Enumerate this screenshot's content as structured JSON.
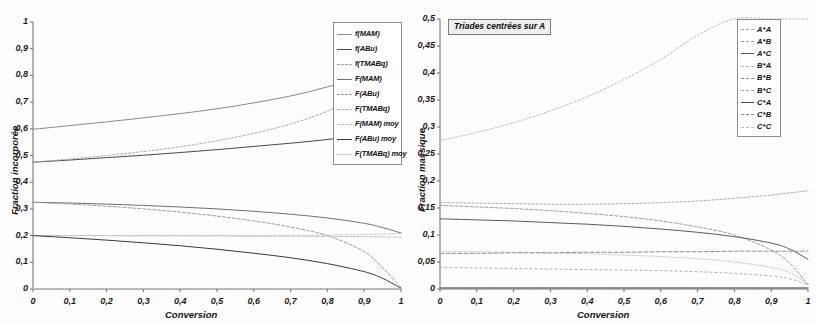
{
  "figure": {
    "background": "#fdfdfd",
    "axis_color": "#6f6f6f",
    "text_color": "#141414"
  },
  "panels": [
    {
      "id": "left",
      "annotation": "",
      "xaxis": {
        "label": "Conversion",
        "min": 0,
        "max": 1,
        "ticks": [
          "0",
          "0,1",
          "0,2",
          "0,3",
          "0,4",
          "0,5",
          "0,6",
          "0,7",
          "0,8",
          "0,9",
          "1"
        ]
      },
      "yaxis": {
        "label": "Fraction incorporée",
        "min": 0,
        "max": 1,
        "ticks": [
          "0",
          "0,1",
          "0,2",
          "0,3",
          "0,4",
          "0,5",
          "0,6",
          "0,7",
          "0,8",
          "0,9",
          "1"
        ]
      },
      "legend": [
        {
          "label": "f(MAM)",
          "color": "#8a8a8a",
          "dash": "none"
        },
        {
          "label": "f(ABu)",
          "color": "#4a4a4a",
          "dash": "none"
        },
        {
          "label": "f(TMABq)",
          "color": "#a8a8a8",
          "dash": "2,2"
        },
        {
          "label": "F(MAM)",
          "color": "#707070",
          "dash": "none"
        },
        {
          "label": "F(ABu)",
          "color": "#9b9b9b",
          "dash": "3,2"
        },
        {
          "label": "F(TMABq)",
          "color": "#b4b4b4",
          "dash": "1,2"
        },
        {
          "label": "F(MAM) moy",
          "color": "#bdbdbd",
          "dash": "4,2"
        },
        {
          "label": "F(ABu) moy",
          "color": "#3a3a3a",
          "dash": "none"
        },
        {
          "label": "F(TMABq) moy",
          "color": "#c2c2c2",
          "dash": "2,3"
        }
      ]
    },
    {
      "id": "right",
      "annotation": "Triades centrées sur A",
      "xaxis": {
        "label": "Conversion",
        "min": 0,
        "max": 1,
        "ticks": [
          "0",
          "0,1",
          "0,2",
          "0,3",
          "0,4",
          "0,5",
          "0,6",
          "0,7",
          "0,8",
          "0,9",
          "1"
        ]
      },
      "yaxis": {
        "label": "Fraction massique",
        "min": 0,
        "max": 0.5,
        "ticks": [
          "0",
          "0,05",
          "0,1",
          "0,15",
          "0,2",
          "0,25",
          "0,3",
          "0,35",
          "0,4",
          "0,45",
          "0,5"
        ]
      },
      "legend": [
        {
          "label": "A*A",
          "color": "#a9a9a9",
          "dash": "2,2"
        },
        {
          "label": "A*B",
          "color": "#9a9a9a",
          "dash": "3,2"
        },
        {
          "label": "A*C",
          "color": "#5a5a5a",
          "dash": "none"
        },
        {
          "label": "B*A",
          "color": "#b8b8b8",
          "dash": "1,2"
        },
        {
          "label": "B*B",
          "color": "#8d8d8d",
          "dash": "4,2"
        },
        {
          "label": "B*C",
          "color": "#ababab",
          "dash": "2,3"
        },
        {
          "label": "C*A",
          "color": "#4d4d4d",
          "dash": "none"
        },
        {
          "label": "C*B",
          "color": "#909090",
          "dash": "3,3"
        },
        {
          "label": "C*C",
          "color": "#bcbcbc",
          "dash": "2,2"
        }
      ]
    }
  ],
  "chart_data": [
    {
      "type": "line",
      "panel": "left",
      "title": "",
      "xlabel": "Conversion",
      "ylabel": "Fraction incorporée",
      "xlim": [
        0,
        1
      ],
      "ylim": [
        0,
        1
      ],
      "grid": false,
      "legend_position": "upper-right-inside",
      "x": [
        0,
        0.1,
        0.2,
        0.3,
        0.4,
        0.5,
        0.6,
        0.7,
        0.8,
        0.9,
        0.95,
        1
      ],
      "series": [
        {
          "name": "f(MAM)",
          "values": [
            0.598,
            0.612,
            0.626,
            0.641,
            0.657,
            0.675,
            0.697,
            0.723,
            0.757,
            0.8,
            0.822,
            0.84
          ]
        },
        {
          "name": "f(ABu)",
          "values": [
            0.475,
            0.483,
            0.492,
            0.501,
            0.511,
            0.522,
            0.534,
            0.546,
            0.56,
            0.578,
            0.588,
            0.598
          ]
        },
        {
          "name": "f(TMABq)",
          "values": [
            0.475,
            0.487,
            0.5,
            0.515,
            0.533,
            0.555,
            0.583,
            0.618,
            0.666,
            0.735,
            0.782,
            0.825
          ]
        },
        {
          "name": "F(MAM)",
          "values": [
            0.325,
            0.322,
            0.318,
            0.313,
            0.307,
            0.3,
            0.291,
            0.28,
            0.266,
            0.246,
            0.23,
            0.21
          ]
        },
        {
          "name": "F(ABu)",
          "values": [
            0.325,
            0.318,
            0.31,
            0.3,
            0.288,
            0.273,
            0.255,
            0.232,
            0.2,
            0.14,
            0.08,
            0.005
          ]
        },
        {
          "name": "F(TMABq)",
          "values": [
            0.2,
            0.2,
            0.2,
            0.2,
            0.2,
            0.2,
            0.2,
            0.201,
            0.202,
            0.204,
            0.206,
            0.208
          ]
        },
        {
          "name": "F(MAM) moy",
          "values": [
            0.2,
            0.2,
            0.2,
            0.199,
            0.199,
            0.199,
            0.198,
            0.198,
            0.197,
            0.196,
            0.195,
            0.194
          ]
        },
        {
          "name": "F(ABu) moy",
          "values": [
            0.2,
            0.192,
            0.183,
            0.173,
            0.162,
            0.149,
            0.134,
            0.117,
            0.095,
            0.065,
            0.04,
            0.003
          ]
        },
        {
          "name": "F(TMABq) moy",
          "values": [
            0.002,
            0.002,
            0.002,
            0.002,
            0.002,
            0.002,
            0.002,
            0.002,
            0.002,
            0.002,
            0.002,
            0.002
          ]
        }
      ]
    },
    {
      "type": "line",
      "panel": "right",
      "title": "Triades centrées sur A",
      "xlabel": "Conversion",
      "ylabel": "Fraction massique",
      "xlim": [
        0,
        1
      ],
      "ylim": [
        0,
        0.5
      ],
      "grid": false,
      "legend_position": "upper-right-inside",
      "x": [
        0,
        0.1,
        0.2,
        0.3,
        0.4,
        0.5,
        0.6,
        0.7,
        0.8,
        0.9,
        0.95,
        1
      ],
      "series": [
        {
          "name": "A*A",
          "values": [
            0.16,
            0.159,
            0.158,
            0.157,
            0.157,
            0.158,
            0.16,
            0.163,
            0.168,
            0.174,
            0.178,
            0.182
          ]
        },
        {
          "name": "A*B",
          "values": [
            0.155,
            0.152,
            0.149,
            0.145,
            0.14,
            0.134,
            0.126,
            0.115,
            0.1,
            0.072,
            0.048,
            0.008
          ]
        },
        {
          "name": "A*C",
          "values": [
            0.13,
            0.128,
            0.126,
            0.123,
            0.12,
            0.116,
            0.111,
            0.105,
            0.097,
            0.085,
            0.074,
            0.055
          ]
        },
        {
          "name": "B*A",
          "values": [
            0.07,
            0.069,
            0.068,
            0.067,
            0.065,
            0.063,
            0.06,
            0.056,
            0.05,
            0.04,
            0.03,
            0.01
          ]
        },
        {
          "name": "B*B",
          "values": [
            0.066,
            0.066,
            0.067,
            0.067,
            0.068,
            0.068,
            0.069,
            0.069,
            0.07,
            0.07,
            0.07,
            0.07
          ]
        },
        {
          "name": "B*C",
          "values": [
            0.04,
            0.039,
            0.038,
            0.037,
            0.036,
            0.035,
            0.034,
            0.032,
            0.029,
            0.024,
            0.019,
            0.008
          ]
        },
        {
          "name": "C*A",
          "values": [
            0.002,
            0.002,
            0.002,
            0.002,
            0.002,
            0.002,
            0.002,
            0.002,
            0.002,
            0.002,
            0.002,
            0.002
          ]
        },
        {
          "name": "C*B",
          "values": [
            0.002,
            0.002,
            0.002,
            0.002,
            0.002,
            0.002,
            0.002,
            0.002,
            0.002,
            0.002,
            0.002,
            0.002
          ]
        },
        {
          "name": "C*C",
          "values": [
            0.275,
            0.29,
            0.308,
            0.33,
            0.356,
            0.388,
            0.425,
            0.47,
            0.5,
            0.5,
            0.5,
            0.5
          ]
        }
      ]
    }
  ]
}
